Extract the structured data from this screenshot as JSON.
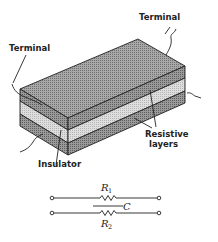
{
  "figure": {
    "type": "diagram",
    "labels": {
      "terminal_top": "Terminal",
      "terminal_left": "Terminal",
      "resistive_line1": "Resistive",
      "resistive_line2": "layers",
      "insulator": "Insulator"
    },
    "circuit": {
      "r1_symbol": "R",
      "r1_sub": "1",
      "r2_symbol": "R",
      "r2_sub": "2",
      "c_symbol": "C"
    },
    "colors": {
      "ink": "#222222",
      "resistive_layer": "#8a8a8a",
      "insulator_layer": "#cfcfcf",
      "background": "#ffffff"
    }
  }
}
